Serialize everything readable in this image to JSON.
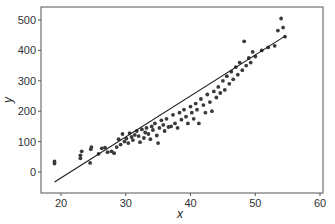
{
  "chart_data": {
    "type": "scatter",
    "title": "",
    "xlabel": "x",
    "ylabel": "y",
    "xlim": [
      17,
      60.5
    ],
    "ylim": [
      -65,
      530
    ],
    "xticks": [
      20,
      30,
      40,
      50,
      60
    ],
    "yticks": [
      0,
      100,
      200,
      300,
      400,
      500
    ],
    "grid": false,
    "legend": null,
    "colors": {
      "points": "#3a3a3a",
      "line": "#1a1a1a",
      "frame": "#555555"
    },
    "regression_line": {
      "x": [
        19.0,
        54.6
      ],
      "y": [
        -33,
        447
      ]
    },
    "series": [
      {
        "name": "observations",
        "points": [
          [
            19.0,
            28
          ],
          [
            19.0,
            35
          ],
          [
            23.0,
            45
          ],
          [
            23.0,
            55
          ],
          [
            23.2,
            68
          ],
          [
            24.5,
            30
          ],
          [
            24.6,
            75
          ],
          [
            24.7,
            82
          ],
          [
            25.8,
            60
          ],
          [
            26.3,
            78
          ],
          [
            26.8,
            80
          ],
          [
            27.2,
            65
          ],
          [
            27.8,
            68
          ],
          [
            28.2,
            62
          ],
          [
            28.6,
            82
          ],
          [
            28.9,
            108
          ],
          [
            29.2,
            90
          ],
          [
            29.5,
            125
          ],
          [
            29.8,
            100
          ],
          [
            30.1,
            110
          ],
          [
            30.4,
            95
          ],
          [
            30.6,
            128
          ],
          [
            30.9,
            115
          ],
          [
            31.1,
            105
          ],
          [
            31.4,
            122
          ],
          [
            31.7,
            135
          ],
          [
            32.0,
            118
          ],
          [
            32.2,
            98
          ],
          [
            32.5,
            140
          ],
          [
            32.8,
            112
          ],
          [
            33.0,
            130
          ],
          [
            33.2,
            145
          ],
          [
            33.5,
            125
          ],
          [
            33.8,
            108
          ],
          [
            34.0,
            150
          ],
          [
            34.2,
            138
          ],
          [
            34.5,
            160
          ],
          [
            34.8,
            120
          ],
          [
            35.0,
            95
          ],
          [
            35.2,
            145
          ],
          [
            35.5,
            170
          ],
          [
            35.8,
            155
          ],
          [
            36.0,
            135
          ],
          [
            36.3,
            175
          ],
          [
            36.6,
            148
          ],
          [
            37.0,
            150
          ],
          [
            37.3,
            188
          ],
          [
            37.6,
            160
          ],
          [
            38.0,
            145
          ],
          [
            38.3,
            195
          ],
          [
            38.6,
            172
          ],
          [
            39.0,
            205
          ],
          [
            39.3,
            182
          ],
          [
            39.6,
            160
          ],
          [
            40.0,
            215
          ],
          [
            40.2,
            195
          ],
          [
            40.5,
            175
          ],
          [
            40.8,
            225
          ],
          [
            41.0,
            205
          ],
          [
            41.3,
            160
          ],
          [
            41.6,
            240
          ],
          [
            42.0,
            220
          ],
          [
            42.3,
            195
          ],
          [
            42.6,
            255
          ],
          [
            43.0,
            230
          ],
          [
            43.3,
            200
          ],
          [
            43.6,
            265
          ],
          [
            44.0,
            245
          ],
          [
            44.3,
            280
          ],
          [
            44.6,
            260
          ],
          [
            45.0,
            300
          ],
          [
            45.3,
            270
          ],
          [
            45.6,
            315
          ],
          [
            46.0,
            290
          ],
          [
            46.3,
            330
          ],
          [
            46.6,
            305
          ],
          [
            47.0,
            345
          ],
          [
            47.3,
            320
          ],
          [
            47.6,
            360
          ],
          [
            48.0,
            335
          ],
          [
            48.3,
            430
          ],
          [
            48.6,
            350
          ],
          [
            49.0,
            375
          ],
          [
            49.3,
            360
          ],
          [
            49.6,
            395
          ],
          [
            50.0,
            380
          ],
          [
            51.0,
            400
          ],
          [
            52.0,
            410
          ],
          [
            53.0,
            415
          ],
          [
            53.5,
            465
          ],
          [
            54.0,
            505
          ],
          [
            54.3,
            475
          ],
          [
            54.6,
            445
          ]
        ]
      }
    ]
  }
}
